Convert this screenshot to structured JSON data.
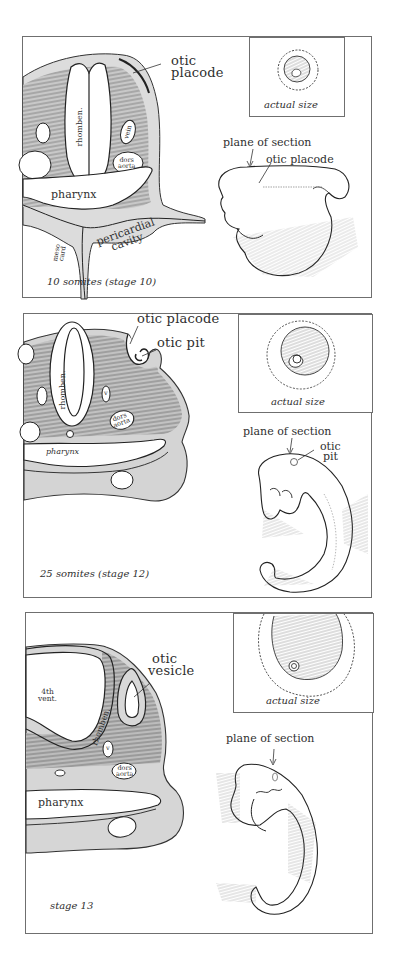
{
  "figure": {
    "panels": [
      {
        "id": "stage-10",
        "caption": "10 somites (stage 10)",
        "inset_label": "actual size",
        "section_labels": {
          "otic_structure_line1": "otic",
          "otic_structure_line2": "placode",
          "neural_tube": "rhomben.",
          "vein": "vein",
          "dorsal_aorta_line1": "dors",
          "dorsal_aorta_line2": "aorta",
          "pharynx": "pharynx",
          "pericardial_line1": "pericardial",
          "pericardial_line2": "cavity",
          "mesocardium_line1": "meso",
          "mesocardium_line2": "card"
        },
        "embryo_labels": {
          "plane": "plane of section",
          "otic": "otic placode"
        }
      },
      {
        "id": "stage-12",
        "caption": "25 somites (stage 12)",
        "inset_label": "actual size",
        "section_labels": {
          "otic_placode": "otic placode",
          "otic_pit": "otic pit",
          "neural_tube": "rhomben.",
          "vein": "v",
          "dorsal_aorta_line1": "dors",
          "dorsal_aorta_line2": "aorta",
          "pharynx": "pharynx"
        },
        "embryo_labels": {
          "plane": "plane of section",
          "otic_line1": "otic",
          "otic_line2": "pit"
        }
      },
      {
        "id": "stage-13",
        "caption": "stage 13",
        "inset_label": "actual size",
        "section_labels": {
          "otic_line1": "otic",
          "otic_line2": "vesicle",
          "ventricle_line1": "4th",
          "ventricle_line2": "vent.",
          "neural_tube": "rhomben.",
          "vein": "v",
          "dorsal_aorta_line1": "dors",
          "dorsal_aorta_line2": "aorta",
          "pharynx": "pharynx"
        },
        "embryo_labels": {
          "plane": "plane of section"
        }
      }
    ]
  },
  "colors": {
    "ink": "#2b2b2b",
    "tissue_light": "#d9d9d9",
    "tissue_dark": "#9a9a9a",
    "border": "#6f6f6f"
  }
}
